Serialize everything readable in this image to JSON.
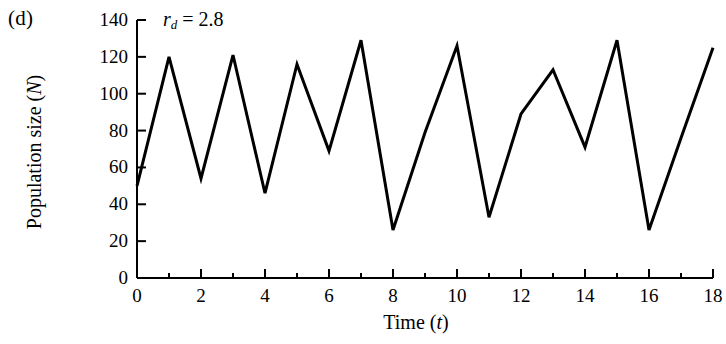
{
  "panel": {
    "label": "(d)"
  },
  "annotation": {
    "symbol": "r",
    "subscript": "d",
    "equals": "=",
    "value": "2.8",
    "full_text": "rd = 2.8"
  },
  "axes": {
    "y_title_text": "Population size (",
    "y_title_var": "N",
    "y_title_close": ")",
    "x_title_text": "Time (",
    "x_title_var": "t",
    "x_title_close": ")"
  },
  "chart_data": {
    "type": "line",
    "title": "",
    "subtitle": "",
    "xlabel": "Time (t)",
    "ylabel": "Population size (N)",
    "xlim": [
      0,
      18
    ],
    "ylim": [
      0,
      140
    ],
    "xticks": [
      0,
      2,
      4,
      6,
      8,
      10,
      12,
      14,
      16,
      18
    ],
    "xtick_labels": [
      "0",
      "2",
      "4",
      "6",
      "8",
      "10",
      "12",
      "14",
      "16",
      "18"
    ],
    "x_minor_ticks": [
      1,
      3,
      5,
      7,
      9,
      11,
      13,
      15,
      17
    ],
    "yticks": [
      0,
      20,
      40,
      60,
      80,
      100,
      120,
      140
    ],
    "ytick_labels": [
      "0",
      "20",
      "40",
      "60",
      "80",
      "100",
      "120",
      "140"
    ],
    "grid": false,
    "legend": false,
    "legend_position": "none",
    "annotations": [
      {
        "text": "rd = 2.8",
        "x": 2.1,
        "y": 136
      }
    ],
    "line_color": "#000000",
    "line_width": 3,
    "x": [
      0,
      1,
      2,
      3,
      4,
      5,
      6,
      7,
      8,
      9,
      10,
      11,
      12,
      13,
      14,
      15,
      16,
      17,
      18
    ],
    "values": [
      50,
      120,
      54,
      121,
      46,
      116,
      69,
      129,
      26,
      79,
      126,
      33,
      89,
      113,
      71,
      129,
      26,
      76,
      125
    ],
    "series": [
      {
        "name": "Population size (N)",
        "values": [
          50,
          120,
          54,
          121,
          46,
          116,
          69,
          129,
          26,
          79,
          126,
          33,
          89,
          113,
          71,
          129,
          26,
          76,
          125
        ]
      }
    ]
  }
}
